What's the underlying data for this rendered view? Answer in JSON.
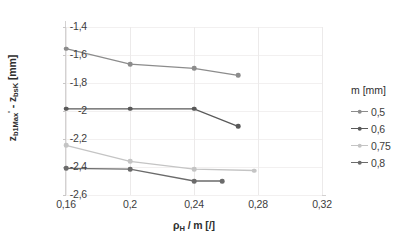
{
  "chart_data": {
    "type": "line",
    "title": "",
    "xlabel": "ρH / m [/]",
    "ylabel": "zb1Max' - zbsK [mm]",
    "xlim": [
      0.16,
      0.32
    ],
    "ylim": [
      -2.6,
      -1.4
    ],
    "xticks": [
      "0,16",
      "0,2",
      "0,24",
      "0,28",
      "0,32"
    ],
    "xtick_values": [
      0.16,
      0.2,
      0.24,
      0.28,
      0.32
    ],
    "yticks": [
      "-1,4",
      "-1,6",
      "-1,8",
      "-2",
      "-2,2",
      "-2,4",
      "-2,6"
    ],
    "ytick_values": [
      -1.4,
      -1.6,
      -1.8,
      -2.0,
      -2.2,
      -2.4,
      -2.6
    ],
    "grid": true,
    "legend_position": "right",
    "legend_title": "m [mm]",
    "series": [
      {
        "name": "0,5",
        "color": "#8c8c8c",
        "x": [
          0.16,
          0.2,
          0.24,
          0.2675
        ],
        "values": [
          -1.555,
          -1.665,
          -1.695,
          -1.745
        ]
      },
      {
        "name": "0,6",
        "color": "#595959",
        "x": [
          0.16,
          0.2,
          0.24,
          0.2675
        ],
        "values": [
          -1.985,
          -1.985,
          -1.985,
          -2.11
        ]
      },
      {
        "name": "0,75",
        "color": "#c4c4c4",
        "x": [
          0.16,
          0.2,
          0.24,
          0.2775
        ],
        "values": [
          -2.245,
          -2.36,
          -2.415,
          -2.425
        ]
      },
      {
        "name": "0,8",
        "color": "#6b6b6b",
        "x": [
          0.16,
          0.2,
          0.24,
          0.2575
        ],
        "values": [
          -2.41,
          -2.415,
          -2.5,
          -2.5
        ]
      }
    ]
  },
  "axis_titles": {
    "y_main": "z",
    "y_sub1": "b1Max",
    "y_prime": "'",
    "y_mid": " - z",
    "y_sub2": "bsK",
    "y_unit": " [mm]",
    "x_main": "ρ",
    "x_sub": "H",
    "x_rest": " / m [/]"
  }
}
